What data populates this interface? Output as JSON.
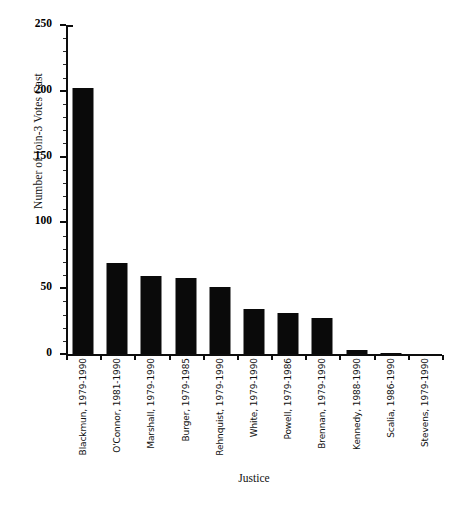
{
  "chart_data": {
    "type": "bar",
    "title": "",
    "xlabel": "Justice",
    "ylabel": "Number of Join-3 Votes Cast",
    "ylim": [
      0,
      250
    ],
    "ytick_values": [
      0,
      50,
      100,
      150,
      200,
      250
    ],
    "ytick_labels": [
      "0",
      "50",
      "100",
      "150",
      "200",
      "250"
    ],
    "ytick_step": 50,
    "minor_ticks": true,
    "grid": false,
    "legend": false,
    "orientation": "vertical",
    "bar_color": "#0a0a0a",
    "categories": [
      "Blackmun, 1979-1990",
      "O'Connor, 1981-1990",
      "Marshall, 1979-1990",
      "Burger, 1979-1985",
      "Rehnquist, 1979-1990",
      "White, 1979-1990",
      "Powell, 1979-1986",
      "Brennan, 1979-1990",
      "Kennedy, 1988-1990",
      "Scalia, 1986-1990",
      "Stevens, 1979-1990"
    ],
    "values": [
      202,
      69,
      59,
      58,
      51,
      34,
      31,
      27,
      3,
      1,
      0
    ]
  },
  "caption": ""
}
